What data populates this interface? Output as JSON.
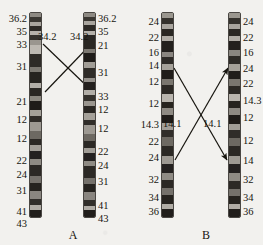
{
  "figure": {
    "type": "chromosome-ideogram-translocation-diagram",
    "background_color": "#f2f1ee",
    "ink_color": "#17150f"
  },
  "panels": [
    {
      "id": "A",
      "caption": "A",
      "caption_x": 63,
      "caption_y": 228,
      "arrow_labels": [
        {
          "text": "34.2",
          "x": 38,
          "y": 31
        },
        {
          "text": "34.2",
          "x": 70,
          "y": 31
        }
      ],
      "arrows": [
        {
          "name": "arrow-a-down",
          "x1": 43,
          "y1": 44,
          "x2": 93,
          "y2": 92
        },
        {
          "name": "arrow-a-up",
          "x1": 45,
          "y1": 92,
          "x2": 94,
          "y2": 41
        }
      ],
      "chromosomes": [
        {
          "id": "A-left",
          "side": "left",
          "x": 29,
          "y": 12,
          "width": 13,
          "height": 206,
          "label_side": "left",
          "labels": [
            {
              "text": "36.2",
              "y": 14
            },
            {
              "text": "35",
              "y": 27
            },
            {
              "text": "33",
              "y": 40
            },
            {
              "text": "31",
              "y": 62
            },
            {
              "text": "21",
              "y": 97
            },
            {
              "text": "12",
              "y": 115
            },
            {
              "text": "12",
              "y": 134
            },
            {
              "text": "22",
              "y": 156
            },
            {
              "text": "24",
              "y": 170
            },
            {
              "text": "31",
              "y": 186
            },
            {
              "text": "41",
              "y": 207
            },
            {
              "text": "43",
              "y": 219
            }
          ],
          "bands": [
            {
              "h": 4,
              "c": "#8e8a83"
            },
            {
              "h": 5,
              "c": "#3a3732"
            },
            {
              "h": 4,
              "c": "#a9a59e"
            },
            {
              "h": 6,
              "c": "#2d2a26"
            },
            {
              "h": 4,
              "c": "#b5b1aa"
            },
            {
              "h": 5,
              "c": "#35322d"
            },
            {
              "h": 5,
              "c": "#9a968f"
            },
            {
              "h": 9,
              "c": "#bdb9b2"
            },
            {
              "h": 14,
              "c": "#2e2b27"
            },
            {
              "h": 5,
              "c": "#7d7972"
            },
            {
              "h": 11,
              "c": "#26231f"
            },
            {
              "h": 6,
              "c": "#b2aea7"
            },
            {
              "h": 8,
              "c": "#2a2723"
            },
            {
              "h": 5,
              "c": "#8b877f"
            },
            {
              "h": 9,
              "c": "#1f1c19"
            },
            {
              "h": 7,
              "c": "#a5a199"
            },
            {
              "h": 6,
              "c": "#302d29"
            },
            {
              "h": 9,
              "c": "#9d9992"
            },
            {
              "h": 8,
              "c": "#6d6962"
            },
            {
              "h": 7,
              "c": "#2b2824"
            },
            {
              "h": 6,
              "c": "#a19d96"
            },
            {
              "h": 8,
              "c": "#242120"
            },
            {
              "h": 6,
              "c": "#8f8b84"
            },
            {
              "h": 12,
              "c": "#2c2925"
            },
            {
              "h": 7,
              "c": "#75716b"
            },
            {
              "h": 8,
              "c": "#26231f"
            },
            {
              "h": 9,
              "c": "#8a8680"
            },
            {
              "h": 6,
              "c": "#312e2a"
            },
            {
              "h": 5,
              "c": "#b0aca5"
            },
            {
              "h": 7,
              "c": "#211e1b"
            }
          ]
        },
        {
          "id": "A-right",
          "side": "right",
          "x": 83,
          "y": 12,
          "width": 13,
          "height": 206,
          "label_side": "right",
          "labels": [
            {
              "text": "36.2",
              "y": 14
            },
            {
              "text": "35",
              "y": 27
            },
            {
              "text": "21",
              "y": 41
            },
            {
              "text": "31",
              "y": 68
            },
            {
              "text": "33",
              "y": 92
            },
            {
              "text": "12",
              "y": 105
            },
            {
              "text": "12",
              "y": 124
            },
            {
              "text": "22",
              "y": 147
            },
            {
              "text": "24",
              "y": 161
            },
            {
              "text": "31",
              "y": 177
            },
            {
              "text": "41",
              "y": 201
            },
            {
              "text": "43",
              "y": 214
            }
          ],
          "bands": [
            {
              "h": 4,
              "c": "#8e8a83"
            },
            {
              "h": 5,
              "c": "#3a3732"
            },
            {
              "h": 4,
              "c": "#a9a59e"
            },
            {
              "h": 6,
              "c": "#2d2a26"
            },
            {
              "h": 5,
              "c": "#b5b1aa"
            },
            {
              "h": 14,
              "c": "#2a2723"
            },
            {
              "h": 5,
              "c": "#7d7972"
            },
            {
              "h": 9,
              "c": "#1f1c19"
            },
            {
              "h": 7,
              "c": "#a19d96"
            },
            {
              "h": 10,
              "c": "#2f2c28"
            },
            {
              "h": 5,
              "c": "#94908a"
            },
            {
              "h": 8,
              "c": "#23201d"
            },
            {
              "h": 6,
              "c": "#b2aea7"
            },
            {
              "h": 6,
              "c": "#35322d"
            },
            {
              "h": 6,
              "c": "#9a968f"
            },
            {
              "h": 7,
              "c": "#2a2723"
            },
            {
              "h": 7,
              "c": "#a5a199"
            },
            {
              "h": 6,
              "c": "#302d29"
            },
            {
              "h": 9,
              "c": "#9d9992"
            },
            {
              "h": 8,
              "c": "#6d6962"
            },
            {
              "h": 7,
              "c": "#2b2824"
            },
            {
              "h": 6,
              "c": "#a19d96"
            },
            {
              "h": 8,
              "c": "#242120"
            },
            {
              "h": 6,
              "c": "#8f8b84"
            },
            {
              "h": 12,
              "c": "#2c2925"
            },
            {
              "h": 7,
              "c": "#75716b"
            },
            {
              "h": 8,
              "c": "#26231f"
            },
            {
              "h": 9,
              "c": "#8a8680"
            },
            {
              "h": 6,
              "c": "#312e2a"
            },
            {
              "h": 5,
              "c": "#b0aca5"
            },
            {
              "h": 7,
              "c": "#211e1b"
            }
          ]
        }
      ]
    },
    {
      "id": "B",
      "caption": "B",
      "caption_x": 196,
      "caption_y": 228,
      "arrow_labels": [
        {
          "text": "14.1",
          "x": 163,
          "y": 118
        },
        {
          "text": "14.1",
          "x": 203,
          "y": 118
        }
      ],
      "arrows": [
        {
          "name": "arrow-b-down",
          "x1": 174,
          "y1": 68,
          "x2": 227,
          "y2": 160
        },
        {
          "name": "arrow-b-up",
          "x1": 175,
          "y1": 160,
          "x2": 228,
          "y2": 68
        }
      ],
      "chromosomes": [
        {
          "id": "B-left",
          "side": "left",
          "x": 161,
          "y": 12,
          "width": 13,
          "height": 206,
          "label_side": "left",
          "labels": [
            {
              "text": "24",
              "y": 17
            },
            {
              "text": "22",
              "y": 33
            },
            {
              "text": "16",
              "y": 48
            },
            {
              "text": "14",
              "y": 61
            },
            {
              "text": "12",
              "y": 77
            },
            {
              "text": "12",
              "y": 99
            },
            {
              "text": "14.3",
              "y": 120
            },
            {
              "text": "22",
              "y": 137
            },
            {
              "text": "24",
              "y": 153
            },
            {
              "text": "32",
              "y": 175
            },
            {
              "text": "34",
              "y": 193
            },
            {
              "text": "36",
              "y": 207
            }
          ],
          "bands": [
            {
              "h": 5,
              "c": "#9b978f"
            },
            {
              "h": 6,
              "c": "#35322d"
            },
            {
              "h": 5,
              "c": "#a9a59e"
            },
            {
              "h": 7,
              "c": "#2a2723"
            },
            {
              "h": 5,
              "c": "#b0aca5"
            },
            {
              "h": 10,
              "c": "#23201d"
            },
            {
              "h": 5,
              "c": "#8a8680"
            },
            {
              "h": 7,
              "c": "#2e2b27"
            },
            {
              "h": 6,
              "c": "#a5a199"
            },
            {
              "h": 9,
              "c": "#201d1a"
            },
            {
              "h": 6,
              "c": "#7a766f"
            },
            {
              "h": 9,
              "c": "#2c2925"
            },
            {
              "h": 8,
              "c": "#b9b5ae"
            },
            {
              "h": 6,
              "c": "#27241f"
            },
            {
              "h": 7,
              "c": "#8e8a83"
            },
            {
              "h": 8,
              "c": "#1f1c19"
            },
            {
              "h": 6,
              "c": "#a19d96"
            },
            {
              "h": 7,
              "c": "#302d29"
            },
            {
              "h": 9,
              "c": "#6d6962"
            },
            {
              "h": 10,
              "c": "#2b2824"
            },
            {
              "h": 8,
              "c": "#9d9992"
            },
            {
              "h": 9,
              "c": "#242120"
            },
            {
              "h": 7,
              "c": "#8f8b84"
            },
            {
              "h": 8,
              "c": "#2c2925"
            },
            {
              "h": 7,
              "c": "#75716b"
            },
            {
              "h": 8,
              "c": "#26231f"
            },
            {
              "h": 5,
              "c": "#b0aca5"
            },
            {
              "h": 8,
              "c": "#211e1b"
            }
          ]
        },
        {
          "id": "B-right",
          "side": "right",
          "x": 228,
          "y": 12,
          "width": 13,
          "height": 206,
          "label_side": "right",
          "labels": [
            {
              "text": "24",
              "y": 17
            },
            {
              "text": "22",
              "y": 33
            },
            {
              "text": "16",
              "y": 48
            },
            {
              "text": "24",
              "y": 64
            },
            {
              "text": "22",
              "y": 79
            },
            {
              "text": "14.3",
              "y": 96
            },
            {
              "text": "12",
              "y": 113
            },
            {
              "text": "12",
              "y": 136
            },
            {
              "text": "14",
              "y": 156
            },
            {
              "text": "32",
              "y": 175
            },
            {
              "text": "34",
              "y": 193
            },
            {
              "text": "36",
              "y": 207
            }
          ],
          "bands": [
            {
              "h": 5,
              "c": "#9b978f"
            },
            {
              "h": 6,
              "c": "#35322d"
            },
            {
              "h": 5,
              "c": "#a9a59e"
            },
            {
              "h": 7,
              "c": "#2a2723"
            },
            {
              "h": 5,
              "c": "#b0aca5"
            },
            {
              "h": 9,
              "c": "#23201d"
            },
            {
              "h": 6,
              "c": "#8a8680"
            },
            {
              "h": 8,
              "c": "#2e2b27"
            },
            {
              "h": 6,
              "c": "#a5a199"
            },
            {
              "h": 8,
              "c": "#201d1a"
            },
            {
              "h": 7,
              "c": "#7a766f"
            },
            {
              "h": 8,
              "c": "#2c2925"
            },
            {
              "h": 7,
              "c": "#b9b5ae"
            },
            {
              "h": 7,
              "c": "#27241f"
            },
            {
              "h": 7,
              "c": "#8e8a83"
            },
            {
              "h": 9,
              "c": "#1f1c19"
            },
            {
              "h": 6,
              "c": "#a19d96"
            },
            {
              "h": 8,
              "c": "#302d29"
            },
            {
              "h": 8,
              "c": "#6d6962"
            },
            {
              "h": 10,
              "c": "#2b2824"
            },
            {
              "h": 8,
              "c": "#9d9992"
            },
            {
              "h": 9,
              "c": "#242120"
            },
            {
              "h": 7,
              "c": "#8f8b84"
            },
            {
              "h": 8,
              "c": "#2c2925"
            },
            {
              "h": 7,
              "c": "#75716b"
            },
            {
              "h": 8,
              "c": "#26231f"
            },
            {
              "h": 5,
              "c": "#b0aca5"
            },
            {
              "h": 8,
              "c": "#211e1b"
            }
          ]
        }
      ]
    }
  ]
}
